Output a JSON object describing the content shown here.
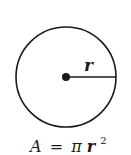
{
  "diagram": {
    "radius_label": "r",
    "formula": {
      "lhs": "A",
      "eq": "=",
      "pi": "π",
      "var": "r",
      "exp": "2"
    },
    "colors": {
      "stroke": "#1a1a1a",
      "background": "#ffffff"
    }
  }
}
